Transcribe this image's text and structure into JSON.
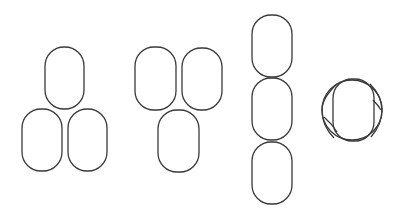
{
  "diagram": {
    "background": "#ffffff",
    "stroke_color": "#3a3a3a",
    "groups": [
      {
        "name": "triangle-one-top-two-bottom",
        "ovals": [
          {
            "x": 45,
            "y": 47,
            "w": 39,
            "h": 62,
            "rx": 19
          },
          {
            "x": 22,
            "y": 109,
            "w": 40,
            "h": 62,
            "rx": 19
          },
          {
            "x": 68,
            "y": 109,
            "w": 39,
            "h": 62,
            "rx": 19
          }
        ]
      },
      {
        "name": "triangle-two-top-one-bottom",
        "ovals": [
          {
            "x": 135,
            "y": 47,
            "w": 41,
            "h": 63,
            "rx": 19
          },
          {
            "x": 182,
            "y": 48,
            "w": 40,
            "h": 62,
            "rx": 19
          },
          {
            "x": 158,
            "y": 110,
            "w": 41,
            "h": 62,
            "rx": 19
          }
        ]
      },
      {
        "name": "vertical-stack",
        "ovals": [
          {
            "x": 252,
            "y": 15,
            "w": 40,
            "h": 62,
            "rx": 19
          },
          {
            "x": 252,
            "y": 78,
            "w": 40,
            "h": 62,
            "rx": 19
          },
          {
            "x": 252,
            "y": 142,
            "w": 40,
            "h": 62,
            "rx": 19
          }
        ]
      },
      {
        "name": "end-on-view",
        "circle": {
          "cx": 352,
          "cy": 110,
          "r": 30
        },
        "ovals": [
          {
            "x": 333,
            "y": 79,
            "w": 41,
            "h": 62,
            "rx": 19
          }
        ]
      }
    ]
  }
}
